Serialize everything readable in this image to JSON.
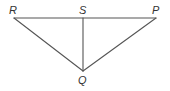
{
  "diagram": {
    "type": "geometry-triangle",
    "stroke_color": "#555555",
    "label_color": "#333333",
    "points": {
      "R": {
        "label": "R",
        "x": 14,
        "y": 18
      },
      "S": {
        "label": "S",
        "x": 83,
        "y": 18
      },
      "P": {
        "label": "P",
        "x": 156,
        "y": 18
      },
      "Q": {
        "label": "Q",
        "x": 83,
        "y": 71
      }
    },
    "segments": [
      {
        "from": "R",
        "to": "P"
      },
      {
        "from": "R",
        "to": "Q"
      },
      {
        "from": "P",
        "to": "Q"
      },
      {
        "from": "S",
        "to": "Q"
      }
    ],
    "labels": {
      "R": "R",
      "S": "S",
      "P": "P",
      "Q": "Q"
    }
  }
}
